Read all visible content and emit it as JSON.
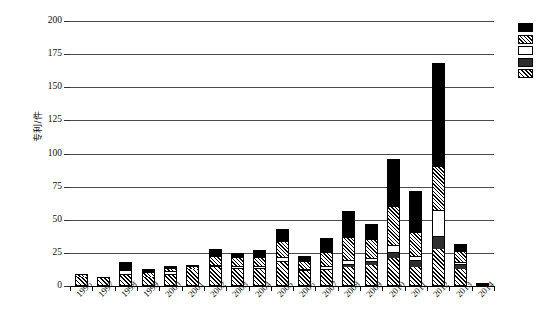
{
  "chart_data": {
    "type": "bar",
    "subtype": "stacked-bar",
    "title": "",
    "xlabel": "",
    "ylabel": "专利/件",
    "ylim": [
      0,
      200
    ],
    "yticks": [
      0,
      25,
      50,
      75,
      100,
      125,
      150,
      175,
      200
    ],
    "grid": true,
    "legend_position": "right-top",
    "categories": [
      "1996",
      "1997",
      "1998",
      "1999",
      "2000",
      "2001",
      "2002",
      "2003",
      "2004",
      "2005",
      "2006",
      "2007",
      "2008",
      "2009",
      "2010",
      "2011",
      "2012",
      "2013",
      "2014"
    ],
    "series": [
      {
        "name": "series-1",
        "pattern": "hatch",
        "values": [
          7,
          6,
          8,
          7,
          8,
          13,
          14,
          13,
          13,
          18,
          11,
          12,
          14,
          16,
          21,
          14,
          28,
          13,
          0
        ]
      },
      {
        "name": "series-2",
        "pattern": "solid-dark",
        "values": [
          0,
          0,
          0,
          0,
          0,
          0,
          0,
          0,
          0,
          0,
          0,
          0,
          2,
          2,
          4,
          5,
          9,
          3,
          0
        ]
      },
      {
        "name": "series-3",
        "pattern": "white",
        "values": [
          0,
          0,
          4,
          0,
          3,
          0,
          2,
          2,
          2,
          4,
          2,
          3,
          4,
          3,
          6,
          4,
          20,
          2,
          0
        ]
      },
      {
        "name": "series-4",
        "pattern": "crosshatch",
        "values": [
          2,
          1,
          0,
          3,
          2,
          1,
          6,
          6,
          6,
          11,
          5,
          10,
          16,
          14,
          29,
          17,
          33,
          8,
          0
        ]
      },
      {
        "name": "series-5",
        "pattern": "solid-black",
        "values": [
          0,
          0,
          6,
          3,
          2,
          2,
          6,
          4,
          6,
          10,
          5,
          11,
          21,
          12,
          36,
          32,
          78,
          6,
          2
        ]
      }
    ],
    "totals": [
      9,
      7,
      18,
      13,
      15,
      16,
      28,
      25,
      27,
      43,
      23,
      36,
      57,
      47,
      96,
      72,
      168,
      32,
      2
    ],
    "legend_items": [
      {
        "name": "legend-item-1",
        "pattern": "solid-black",
        "label": ""
      },
      {
        "name": "legend-item-2",
        "pattern": "crosshatch",
        "label": ""
      },
      {
        "name": "legend-item-3",
        "pattern": "white",
        "label": ""
      },
      {
        "name": "legend-item-4",
        "pattern": "solid-dark",
        "label": ""
      },
      {
        "name": "legend-item-5",
        "pattern": "hatch",
        "label": ""
      }
    ],
    "colors": {
      "solid-black": "#000000",
      "solid-dark": "#2e2e2e",
      "white": "#ffffff",
      "axis": "#000000",
      "gridline": "#4a4a4a"
    }
  }
}
